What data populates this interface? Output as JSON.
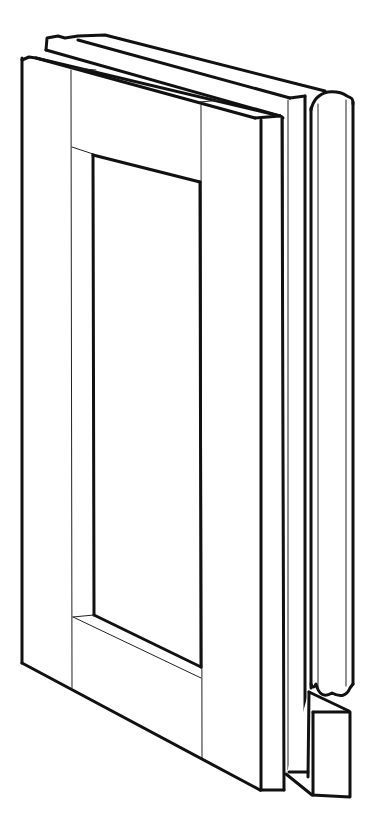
{
  "illustration": {
    "subject": "cabinet door frame with glazing bead and sash profile (line drawing)",
    "background": "#ffffff",
    "ink": "#111111"
  }
}
